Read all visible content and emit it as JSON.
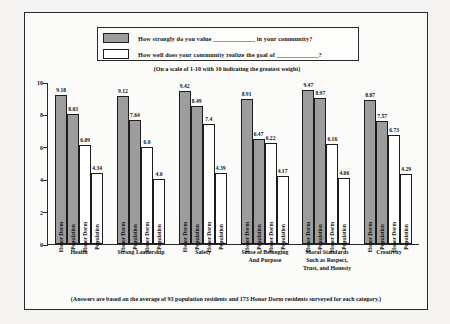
{
  "legend": {
    "series": [
      {
        "key": "value",
        "label": "How strongly do you value _____________ in your community?",
        "swatch": "filled",
        "color": "#9d9d9d"
      },
      {
        "key": "realize",
        "label": "How well does your community realize the goal of _____________?",
        "swatch": "open",
        "color": "#ffffff"
      }
    ]
  },
  "scale_note": "(On a scale of 1-10 with 10 indicating the greatest weight)",
  "footer_note": "(Answers are based on the average of 93 population residents and 173 Honor Dorm residents surveyed for each category.)",
  "axis": {
    "yticks": [
      "10",
      "8",
      "6",
      "4",
      "2",
      "0"
    ]
  },
  "bar_labels": {
    "honor": "Honor Dorm",
    "population": "Population"
  },
  "chart_data": {
    "type": "bar",
    "title": "",
    "subtitle": "(On a scale of 1-10 with 10 indicating the greatest weight)",
    "xlabel": "",
    "ylabel": "",
    "ylim": [
      0,
      10
    ],
    "ytick_values": [
      0,
      2,
      4,
      6,
      8,
      10
    ],
    "grid": false,
    "legend_position": "top",
    "categories": [
      "Health",
      "Strong Leadership",
      "Safety",
      "Sense of Belonging And Purpose",
      "Moral Standards Such as Respect, Trust, and Honesty",
      "Creativity"
    ],
    "category_lines": [
      [
        "Health"
      ],
      [
        "Strong Leadership"
      ],
      [
        "Safety"
      ],
      [
        "Sense of Belonging",
        "And Purpose"
      ],
      [
        "Moral Standards",
        "Such as Respect,",
        "Trust, and Honesty"
      ],
      [
        "Creativity"
      ]
    ],
    "series": [
      {
        "name": "How strongly do you value _____________ in your community? — Honor Dorm",
        "group": "value",
        "respondent": "Honor Dorm",
        "style": "filled",
        "values": [
          9.18,
          9.12,
          9.42,
          8.91,
          9.47,
          8.87
        ]
      },
      {
        "name": "How strongly do you value _____________ in your community? — Population",
        "group": "value",
        "respondent": "Population",
        "style": "filled",
        "values": [
          8.03,
          7.64,
          8.49,
          6.47,
          8.97,
          7.57
        ]
      },
      {
        "name": "How well does your community realize the goal of _____________? — Honor Dorm",
        "group": "realize",
        "respondent": "Honor Dorm",
        "style": "open",
        "values": [
          6.09,
          6.0,
          7.4,
          6.22,
          6.16,
          6.73
        ]
      },
      {
        "name": "How well does your community realize the goal of _____________? — Population",
        "group": "realize",
        "respondent": "Population",
        "style": "open",
        "values": [
          4.34,
          4.0,
          4.39,
          4.17,
          4.06,
          4.29
        ]
      }
    ],
    "value_labels": [
      [
        "9.18",
        "8.03",
        "6.09",
        "4.34"
      ],
      [
        "9.12",
        "7.64",
        "6.0",
        "4.0"
      ],
      [
        "9.42",
        "8.49",
        "7.4",
        "4.39"
      ],
      [
        "8.91",
        "6.47",
        "6.22",
        "4.17"
      ],
      [
        "9.47",
        "8.97",
        "6.16",
        "4.06"
      ],
      [
        "8.87",
        "7.57",
        "6.73",
        "4.29"
      ]
    ],
    "sample_sizes": {
      "population_residents": 93,
      "honor_dorm_residents": 173
    }
  }
}
